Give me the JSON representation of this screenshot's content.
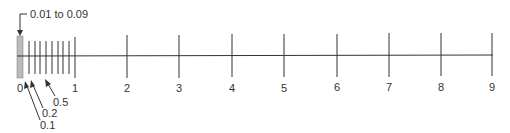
{
  "diagram": {
    "colors": {
      "line": "#333333",
      "shade": "#bbbbbb",
      "text": "#333333"
    },
    "major_ticks": [
      "0",
      "1",
      "2",
      "3",
      "4",
      "5",
      "6",
      "7",
      "8",
      "9"
    ],
    "minor_ticks_between_0_and_1": [
      "0.1",
      "0.2",
      "0.3",
      "0.4",
      "0.5",
      "0.6",
      "0.7",
      "0.8",
      "0.9"
    ],
    "shaded_region_label": "0.01 to 0.09",
    "callouts": [
      {
        "label": "0.5",
        "points_to": "0.5"
      },
      {
        "label": "0.2",
        "points_to": "0.2"
      },
      {
        "label": "0.1",
        "points_to": "0.1"
      }
    ]
  }
}
